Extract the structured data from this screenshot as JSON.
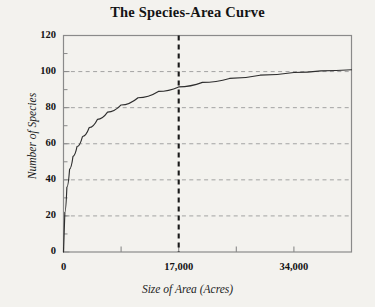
{
  "chart_data": {
    "type": "line",
    "title": "The Species-Area Curve",
    "xlabel": "Size of Area (Acres)",
    "ylabel": "Number of Species",
    "xlim": [
      0,
      42500
    ],
    "ylim": [
      0,
      120
    ],
    "grid": true,
    "grid_axis": "y",
    "legend": "none",
    "yticks": [
      0,
      20,
      40,
      60,
      80,
      100,
      120
    ],
    "ytick_labels": [
      "0",
      "20",
      "40",
      "60",
      "80",
      "100",
      "120"
    ],
    "ygrid_values": [
      20,
      40,
      60,
      80,
      100
    ],
    "xticks": [
      0,
      8500,
      17000,
      25500,
      34000
    ],
    "xtick_labels": [
      "0",
      "",
      "17,000",
      "",
      "34,000"
    ],
    "xtick_labels_shown": [
      "0",
      "17,000",
      "34,000"
    ],
    "annotations": [
      {
        "name": "reference-line-17000",
        "type": "vline",
        "x": 17000,
        "style": "bold-dashed",
        "intersects_curve_at_y": 80
      }
    ],
    "series": [
      {
        "name": "species-area curve",
        "x": [
          0,
          200,
          500,
          900,
          1400,
          2000,
          2800,
          3800,
          5000,
          6500,
          8500,
          11000,
          14000,
          17000,
          20500,
          24500,
          29000,
          34000,
          38000,
          42500
        ],
        "y": [
          0,
          22,
          36,
          46,
          53,
          58.5,
          64,
          69,
          73.5,
          77.5,
          81.5,
          85.5,
          89,
          91.5,
          94,
          96.2,
          98,
          99.5,
          100.4,
          101
        ]
      }
    ]
  },
  "colors": {
    "background": "#f3f2ee",
    "frame": "#8a8a8a",
    "grid": "#9a9a9a",
    "curve": "#2e2e2e",
    "reference_line": "#1a1a1a",
    "text": "#141414"
  }
}
